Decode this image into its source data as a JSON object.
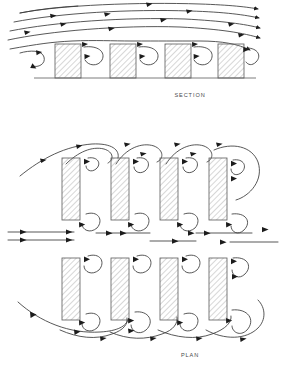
{
  "figure": {
    "title_section": "SECTION",
    "title_plan": "PLAN",
    "colors": {
      "background": "#ffffff",
      "building_outline": "#5a5a5a",
      "hatch": "#8c8c8c",
      "streamline": "#3a3a3a",
      "arrowhead": "#1c1c1c",
      "ground": "#6e6e6e",
      "caption": "#4a4a4a"
    }
  },
  "section": {
    "label": "SECTION",
    "label_pos": {
      "x": 190,
      "y": 97
    },
    "ground": {
      "x1": 34,
      "x2": 256,
      "y": 78
    },
    "building_count": 4,
    "buildings": [
      {
        "x": 55,
        "y": 44,
        "w": 26,
        "h": 34
      },
      {
        "x": 110,
        "y": 44,
        "w": 26,
        "h": 34
      },
      {
        "x": 165,
        "y": 44,
        "w": 26,
        "h": 34
      },
      {
        "x": 218,
        "y": 44,
        "w": 26,
        "h": 34
      }
    ],
    "streamline_count": 5,
    "vortex_count": 4,
    "flow_direction": "left-to-right"
  },
  "plan": {
    "label": "PLAN",
    "label_pos": {
      "x": 190,
      "y": 357
    },
    "building_count": 8,
    "rows": 2,
    "columns": 4,
    "buildings": [
      {
        "x": 62,
        "y": 158,
        "w": 18,
        "h": 62
      },
      {
        "x": 111,
        "y": 158,
        "w": 18,
        "h": 62
      },
      {
        "x": 160,
        "y": 158,
        "w": 18,
        "h": 62
      },
      {
        "x": 209,
        "y": 158,
        "w": 18,
        "h": 62
      },
      {
        "x": 62,
        "y": 258,
        "w": 18,
        "h": 62
      },
      {
        "x": 111,
        "y": 258,
        "w": 18,
        "h": 62
      },
      {
        "x": 160,
        "y": 258,
        "w": 18,
        "h": 62
      },
      {
        "x": 209,
        "y": 258,
        "w": 18,
        "h": 62
      }
    ],
    "inflow_lines": 2,
    "inflow_y": [
      232,
      240
    ],
    "flow_direction": "left-to-right",
    "vortex_count": 16
  }
}
